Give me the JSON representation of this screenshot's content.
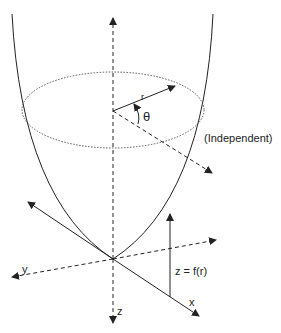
{
  "diagram": {
    "labels": {
      "r": "r",
      "theta": "θ",
      "independent": "(Independent)",
      "y_axis": "y",
      "x_axis": "x",
      "z_axis": "z",
      "function": "z = f(r)"
    },
    "colors": {
      "line": "#222222",
      "background": "#ffffff"
    }
  }
}
